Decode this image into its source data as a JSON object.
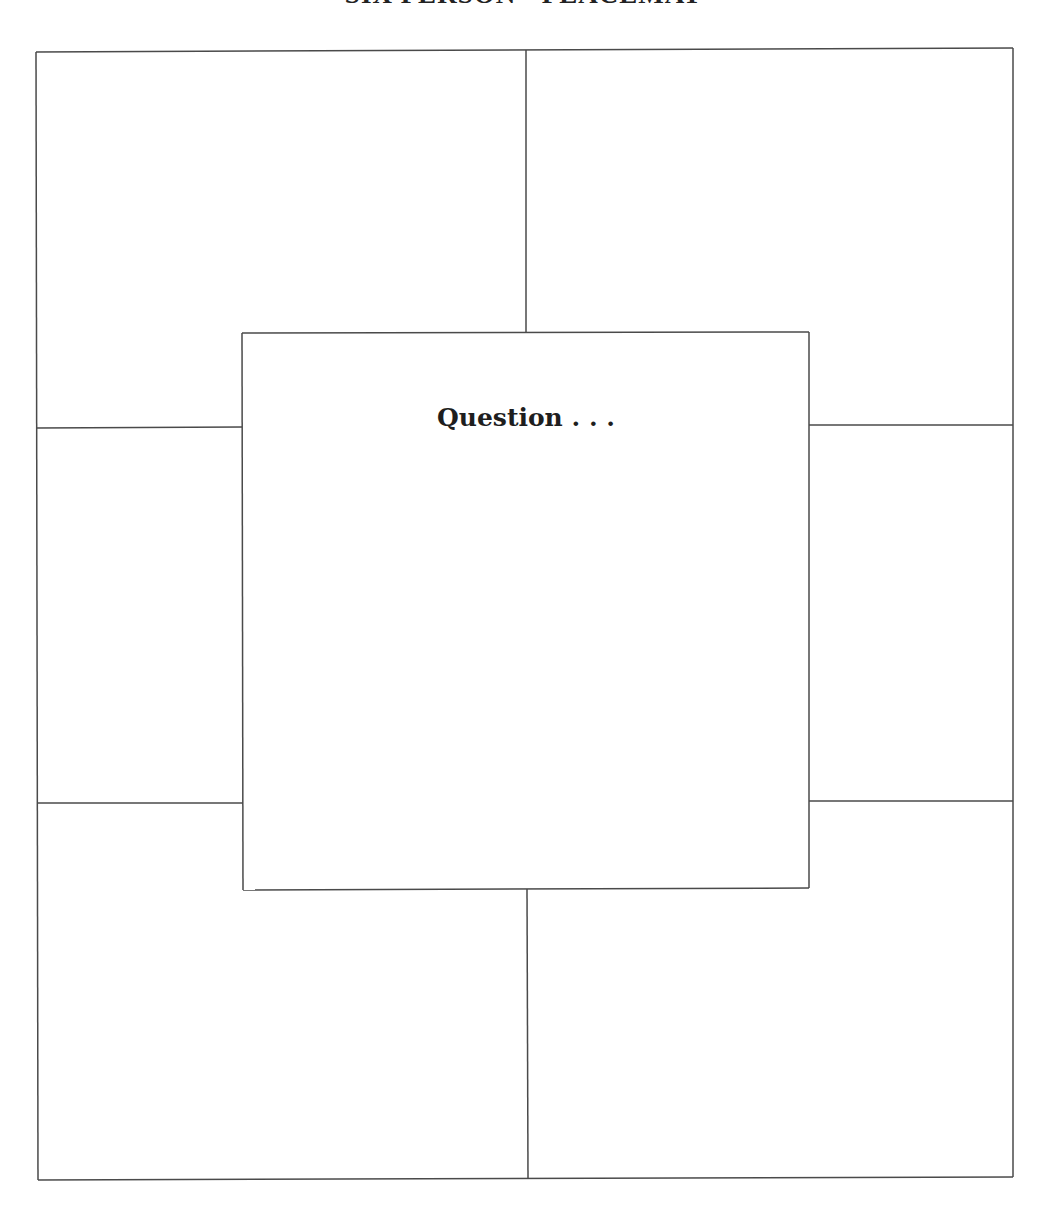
{
  "document": {
    "title": "SIX PERSON - PLACEMAT",
    "center_prompt": "Question . . .",
    "line_color": "#4a4a4a",
    "background_color": "#ffffff"
  },
  "layout": {
    "outer_frame": {
      "top_left": [
        36,
        52
      ],
      "top_right": [
        1013,
        48
      ],
      "bottom_right": [
        1013,
        1177
      ],
      "bottom_left": [
        38,
        1180
      ]
    },
    "center_box": {
      "top_left": [
        242,
        333
      ],
      "top_right": [
        809,
        332
      ],
      "bottom_right": [
        809,
        888
      ],
      "bottom_left": [
        243,
        890
      ]
    },
    "dividers": [
      {
        "name": "top-vertical-divider",
        "x1": 526,
        "y1": 50,
        "x2": 526,
        "y2": 332
      },
      {
        "name": "bottom-vertical-divider",
        "x1": 527,
        "y1": 889,
        "x2": 528,
        "y2": 1179
      },
      {
        "name": "upper-left-divider",
        "x1": 37,
        "y1": 428,
        "x2": 242,
        "y2": 427
      },
      {
        "name": "lower-left-divider",
        "x1": 37,
        "y1": 803,
        "x2": 243,
        "y2": 803
      },
      {
        "name": "upper-right-divider",
        "x1": 809,
        "y1": 425,
        "x2": 1013,
        "y2": 425
      },
      {
        "name": "lower-right-divider",
        "x1": 809,
        "y1": 801,
        "x2": 1013,
        "y2": 801
      }
    ]
  },
  "regions": [
    {
      "name": "person-1-area",
      "position": "top-left",
      "content": ""
    },
    {
      "name": "person-2-area",
      "position": "top-right",
      "content": ""
    },
    {
      "name": "person-3-area",
      "position": "middle-left",
      "content": ""
    },
    {
      "name": "person-4-area",
      "position": "middle-right",
      "content": ""
    },
    {
      "name": "person-5-area",
      "position": "bottom-left",
      "content": ""
    },
    {
      "name": "person-6-area",
      "position": "bottom-right",
      "content": ""
    },
    {
      "name": "question-area",
      "position": "center",
      "content": ""
    }
  ]
}
